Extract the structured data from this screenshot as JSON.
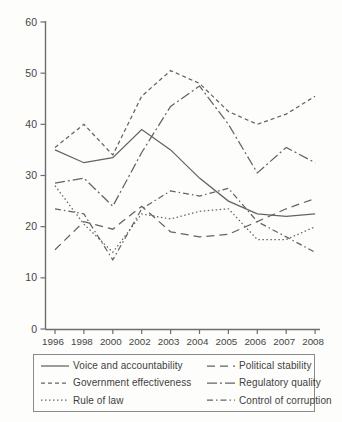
{
  "chart_data": {
    "type": "line",
    "title": "",
    "xlabel": "",
    "ylabel": "",
    "categories": [
      "1996",
      "1998",
      "2000",
      "2002",
      "2003",
      "2004",
      "2005",
      "2006",
      "2007",
      "2008"
    ],
    "series": [
      {
        "name": "Voice and accountability",
        "values": [
          35,
          32.5,
          33.5,
          39,
          35,
          29.5,
          25,
          22.5,
          22,
          22.5
        ],
        "dash": "",
        "legend_slot": "col1-row1"
      },
      {
        "name": "Government effectiveness",
        "values": [
          35.5,
          40,
          34,
          45.5,
          50.5,
          48,
          42.5,
          40,
          42,
          45.5
        ],
        "dash": "4 3",
        "legend_slot": "col1-row2"
      },
      {
        "name": "Rule of law",
        "values": [
          28,
          20.5,
          15,
          22.5,
          21.5,
          23,
          23.5,
          17.5,
          17.5,
          20
        ],
        "dash": "1.5 2.5",
        "legend_slot": "col1-row3"
      },
      {
        "name": "Political stability",
        "values": [
          15.5,
          21,
          19.5,
          24,
          19,
          18,
          18.5,
          21,
          23.5,
          25.5
        ],
        "dash": "8 5",
        "legend_slot": "col2-row1"
      },
      {
        "name": "Regulatory quality",
        "values": [
          28.5,
          29.5,
          24,
          34.5,
          43.5,
          47.5,
          40,
          30.5,
          35.5,
          32.5
        ],
        "dash": "10 3 2 3",
        "legend_slot": "col2-row2"
      },
      {
        "name": "Control of corruption",
        "values": [
          23.5,
          22.5,
          13.5,
          23.5,
          27,
          26,
          27.5,
          21,
          18,
          15
        ],
        "dash": "6 3 1.5 3",
        "legend_slot": "col2-row3"
      }
    ],
    "ylim": [
      0,
      60
    ],
    "yticks": [
      0,
      10,
      20,
      30,
      40,
      50,
      60
    ],
    "grid": false,
    "legend_position": "bottom-box-two-columns",
    "line_color": "#636363",
    "axis_color": "#6e6e6e",
    "text_color": "#454545"
  }
}
